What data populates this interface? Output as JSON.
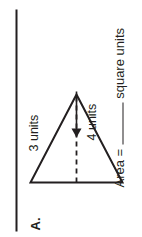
{
  "worksheet": {
    "problem_label": "A.",
    "figure": {
      "shape_name": "triangle",
      "height_label": "3 units",
      "base_label": "4 units",
      "height_units": 3,
      "base_units": 4,
      "stroke_color": "#231f20"
    },
    "answer_line": {
      "prefix": "Area =",
      "blank_value": "",
      "suffix": "square units"
    },
    "rule_color": "#231f20",
    "page_background": "#ffffff",
    "text_color": "#231f20"
  }
}
